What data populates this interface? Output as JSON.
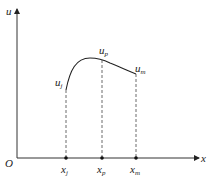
{
  "diagram": {
    "axes": {
      "y_label": "u",
      "x_label": "x",
      "origin_label": "O"
    },
    "curve_points": [
      {
        "name": "j",
        "u_label": "u",
        "u_sub": "j",
        "x_label": "x",
        "x_sub": "j"
      },
      {
        "name": "p",
        "u_label": "u",
        "u_sub": "p",
        "x_label": "x",
        "x_sub": "p"
      },
      {
        "name": "m",
        "u_label": "u",
        "u_sub": "m",
        "x_label": "x",
        "x_sub": "m"
      }
    ],
    "colors": {
      "line": "#222222",
      "dashed": "#444444"
    }
  }
}
